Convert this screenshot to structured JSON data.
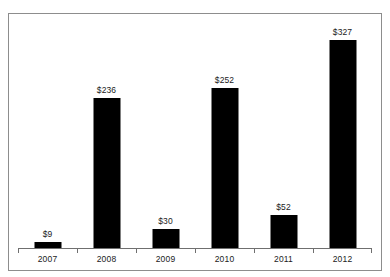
{
  "chart_data": {
    "type": "bar",
    "title": "",
    "subtitle": "",
    "xlabel": "",
    "ylabel": "",
    "categories": [
      "2007",
      "2008",
      "2009",
      "2010",
      "2011",
      "2012"
    ],
    "values": [
      9,
      236,
      30,
      252,
      52,
      327
    ],
    "data_labels": [
      "$9",
      "$236",
      "$30",
      "$252",
      "$52",
      "$327"
    ],
    "series": [
      {
        "name": "",
        "values": [
          9,
          236,
          30,
          252,
          52,
          327
        ]
      }
    ],
    "ylim": [
      0,
      327
    ],
    "grid": false,
    "legend": false,
    "legend_position": "none",
    "value_prefix": "$",
    "axis_tick_labels_y": [],
    "bar_color": "#000000",
    "axis_color": "#6f6f6f",
    "frame_color": "#8d8d8d",
    "background_color": "#ffffff",
    "label_color": "#1b1b1b"
  }
}
